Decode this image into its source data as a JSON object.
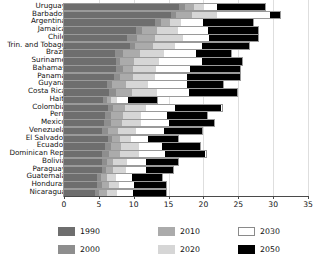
{
  "chart_data": {
    "type": "bar",
    "orientation": "horizontal",
    "stacked": true,
    "title": "",
    "subtitle": "",
    "xlabel": "",
    "ylabel": "",
    "xlim": [
      0,
      35
    ],
    "xticks": [
      0,
      5,
      10,
      15,
      20,
      25,
      30,
      35
    ],
    "xtick_labels": [
      "0",
      "5",
      "10",
      "15",
      "20",
      "25",
      "30",
      "35"
    ],
    "grid": true,
    "grid_axis": "x",
    "legend_position": "bottom",
    "legend_entries": [
      "1990",
      "2000",
      "2010",
      "2020",
      "2030",
      "2050"
    ],
    "series_colors": {
      "1990": "#6e6e6e",
      "2000": "#8e8e8e",
      "2010": "#ababab",
      "2020": "#d6d6d6",
      "2030": "#ffffff",
      "2050": "#000000"
    },
    "categories": [
      "Uruguay",
      "Barbados",
      "Argentina",
      "Jamaica",
      "Chile",
      "Trin. and Tobago",
      "Brazil",
      "Suriname",
      "Bahamas",
      "Panama",
      "Guyana",
      "Costa Rica",
      "Haiti",
      "Colombia",
      "Peru",
      "Mexico",
      "Venezuela",
      "El Salvador",
      "Ecuador",
      "Dominican Rep.",
      "Bolivia",
      "Paraguay",
      "Guatemala",
      "Honduras",
      "Nicaragua"
    ],
    "series": [
      {
        "name": "1990",
        "values": [
          16.5,
          15.4,
          13.1,
          10.3,
          9.1,
          9.4,
          7.3,
          7.5,
          7.4,
          7.2,
          6.2,
          6.4,
          5.6,
          6.3,
          5.9,
          5.8,
          5.4,
          6.3,
          5.9,
          5.5,
          5.4,
          5.4,
          4.8,
          4.8,
          4.4
        ]
      },
      {
        "name": "2000",
        "values": [
          0.9,
          0.6,
          0.8,
          0.9,
          1.4,
          0.8,
          1.1,
          0.6,
          1.0,
          0.9,
          0.7,
          1.1,
          0.5,
          0.8,
          0.9,
          1.0,
          0.9,
          0.6,
          0.8,
          0.9,
          0.7,
          0.6,
          0.5,
          0.6,
          0.6
        ]
      },
      {
        "name": "2010",
        "values": [
          1.2,
          2.3,
          1.3,
          2.1,
          2.6,
          2.6,
          2.5,
          1.9,
          1.5,
          1.8,
          2.0,
          2.2,
          0.6,
          1.7,
          1.6,
          1.5,
          1.4,
          1.1,
          1.5,
          1.6,
          1.0,
          1.0,
          0.8,
          1.0,
          1.1
        ]
      },
      {
        "name": "2020",
        "values": [
          1.5,
          3.6,
          1.6,
          3.0,
          4.0,
          3.1,
          3.5,
          3.6,
          3.3,
          3.2,
          3.2,
          3.6,
          0.9,
          3.0,
          2.6,
          2.8,
          2.7,
          1.6,
          2.5,
          2.7,
          1.9,
          1.9,
          1.4,
          1.5,
          1.5
        ]
      },
      {
        "name": "2030",
        "values": [
          1.9,
          7.6,
          3.1,
          4.4,
          3.7,
          3.9,
          4.6,
          6.2,
          4.9,
          4.6,
          5.5,
          4.6,
          1.6,
          4.2,
          3.8,
          4.0,
          4.0,
          2.4,
          3.4,
          3.8,
          2.7,
          2.8,
          2.2,
          2.2,
          2.3
        ]
      },
      {
        "name": "2050",
        "values": [
          6.8,
          1.5,
          7.2,
          7.1,
          7.0,
          6.8,
          4.9,
          5.7,
          7.1,
          7.5,
          5.2,
          6.9,
          4.2,
          6.6,
          5.7,
          6.4,
          5.4,
          4.4,
          5.4,
          5.8,
          4.7,
          4.0,
          4.3,
          4.6,
          4.7
        ]
      }
    ]
  }
}
